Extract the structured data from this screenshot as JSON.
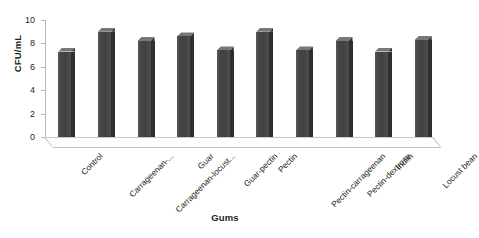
{
  "chart_data": {
    "type": "bar",
    "title": "",
    "xlabel": "Gums",
    "ylabel": "CFU/mL",
    "categories": [
      "Control",
      "Carrageenan-...",
      "Carrageenan-locust...",
      "Guar",
      "Guar-pectin",
      "Pectin",
      "Pectin-carrageenan",
      "Pectin-dextrose",
      "Inulin",
      "Locust bean"
    ],
    "values": [
      7.3,
      9.0,
      8.2,
      8.6,
      7.4,
      9.0,
      7.4,
      8.2,
      7.3,
      8.3
    ],
    "ylim": [
      0,
      10
    ],
    "yticks": [
      0,
      2,
      4,
      6,
      8,
      10
    ],
    "ytick_labels": [
      "0",
      "2",
      "4",
      "6",
      "8",
      "10"
    ],
    "grid": false,
    "legend": false,
    "bar_color": "#4a4a4a",
    "bar_side_color": "#2f2f2f",
    "bar_top_color": "#777777",
    "axis_color": "#b9b9b9",
    "text_color": "#231f20",
    "background": "#ffffff",
    "style": "3d-column"
  }
}
